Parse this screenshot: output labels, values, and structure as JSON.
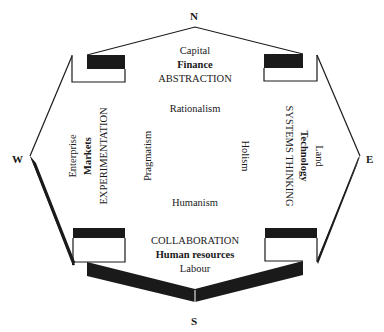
{
  "compass": {
    "north": "N",
    "south": "S",
    "west": "W",
    "east": "E"
  },
  "quadrants": {
    "north": {
      "resource": "Capital",
      "domain": "Finance",
      "approach": "ABSTRACTION"
    },
    "south": {
      "approach": "COLLABORATION",
      "domain": "Human resources",
      "resource": "Labour"
    },
    "west": {
      "resource": "Enterprise",
      "domain": "Markets",
      "approach": "EXPERIMENTATION"
    },
    "east": {
      "resource": "Land",
      "domain": "Technology",
      "approach": "SYSTEMS THINKING"
    }
  },
  "philosophies": {
    "north": "Rationalism",
    "south": "Humanism",
    "west": "Pragmatism",
    "east": "Holism"
  },
  "colors": {
    "stroke": "#1a1a1a",
    "background": "#ffffff"
  }
}
